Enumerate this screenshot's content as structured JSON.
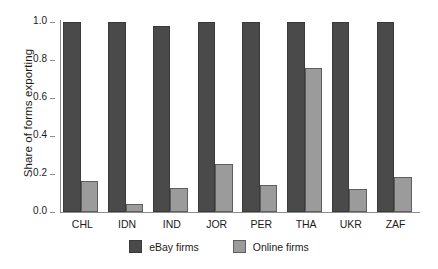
{
  "chart_data": {
    "type": "bar",
    "title": "",
    "xlabel": "",
    "ylabel": "Share of forms exporting",
    "ylim": [
      0.0,
      1.0
    ],
    "yticks": [
      "0.0",
      "0.2",
      "0.4",
      "0.6",
      "0.8",
      "1.0"
    ],
    "ytick_values": [
      0.0,
      0.2,
      0.4,
      0.6,
      0.8,
      1.0
    ],
    "grid": false,
    "legend_position": "bottom-center",
    "categories": [
      "CHL",
      "IDN",
      "IND",
      "JOR",
      "PER",
      "THA",
      "UKR",
      "ZAF"
    ],
    "series": [
      {
        "name": "eBay firms",
        "color": "#4a4a4a",
        "values": [
          1.0,
          1.0,
          0.98,
          1.0,
          1.0,
          1.0,
          1.0,
          1.0
        ]
      },
      {
        "name": "Online firms",
        "color": "#9b9b9b",
        "values": [
          0.163,
          0.042,
          0.127,
          0.251,
          0.143,
          0.757,
          0.12,
          0.185
        ]
      }
    ]
  },
  "legend": {
    "entries": [
      {
        "label": "eBay firms"
      },
      {
        "label": "Online firms"
      }
    ]
  }
}
